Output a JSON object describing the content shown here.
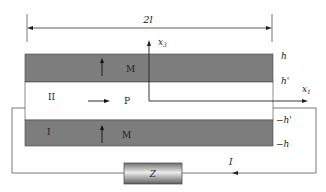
{
  "diagram": {
    "dimension": {
      "label": "2l"
    },
    "axes": {
      "vertical": "x3",
      "vertical_base": "x",
      "vertical_sub": "3",
      "horizontal": "x1",
      "horizontal_base": "x",
      "horizontal_sub": "1"
    },
    "layers": [
      {
        "id": "top",
        "magnetization_label": "M",
        "region_label": ""
      },
      {
        "id": "middle",
        "region_label": "II",
        "polarization_label": "P"
      },
      {
        "id": "bottom",
        "region_label": "I",
        "magnetization_label": "M"
      }
    ],
    "interfaces": {
      "h": "h",
      "h_prime": "h'",
      "neg_h_prime": "−h'",
      "neg_h": "−h"
    },
    "circuit": {
      "load_label": "Z",
      "current_label": "I"
    },
    "colors": {
      "magnetic_layer": "#7d7d7d",
      "piezo_layer": "#ffffff",
      "line": "#333333",
      "load_light": "#e6e6e6",
      "load_dark": "#6f6f6f"
    }
  }
}
